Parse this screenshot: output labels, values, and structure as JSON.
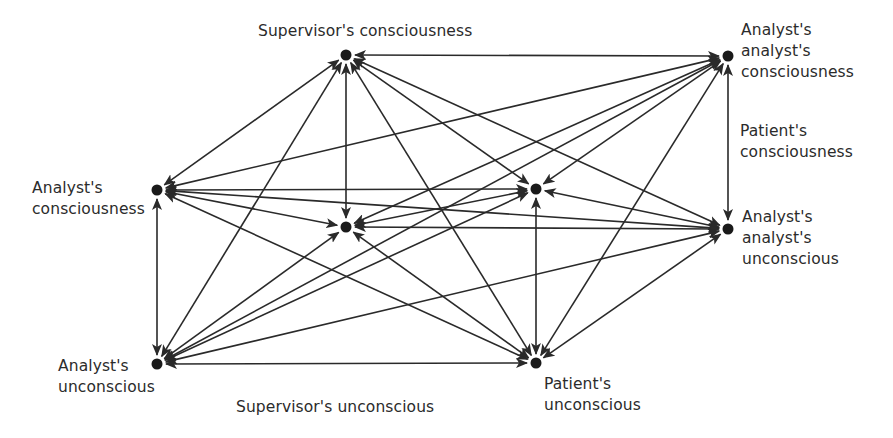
{
  "colors": {
    "ink": "#2a2a2a",
    "node": "#1a1a1a",
    "text": "#2b2b2b",
    "background": "#ffffff"
  },
  "nodes": [
    {
      "id": "sup_c",
      "label": "Supervisor's consciousness",
      "x": 346,
      "y": 55
    },
    {
      "id": "aa_c",
      "label": "Analyst's\nanalyst's\nconsciousness",
      "x": 728,
      "y": 56
    },
    {
      "id": "an_c",
      "label": "Analyst's\nconsciousness",
      "x": 157,
      "y": 190
    },
    {
      "id": "pat_c",
      "label": "Patient's\nconsciousness",
      "x": 536,
      "y": 189
    },
    {
      "id": "sup_u",
      "label": "Supervisor's unconscious",
      "x": 346,
      "y": 227
    },
    {
      "id": "aa_u",
      "label": "Analyst's\nanalyst's\nunconscious",
      "x": 728,
      "y": 229
    },
    {
      "id": "an_u",
      "label": "Analyst's\nunconscious",
      "x": 157,
      "y": 364
    },
    {
      "id": "pat_u",
      "label": "Patient's\nunconscious",
      "x": 536,
      "y": 363
    }
  ],
  "labels": {
    "sup_c": {
      "text": "Supervisor's consciousness",
      "left": 258,
      "top": 21
    },
    "aa_c": {
      "text": "Analyst's\nanalyst's\nconsciousness",
      "left": 741,
      "top": 20
    },
    "pat_c": {
      "text": "Patient's\nconsciousness",
      "left": 740,
      "top": 121
    },
    "an_c": {
      "text": "Analyst's\nconsciousness",
      "left": 32,
      "top": 178
    },
    "aa_u": {
      "text": "Analyst's\nanalyst's\nunconscious",
      "left": 742,
      "top": 207
    },
    "an_u": {
      "text": "Analyst's\nunconscious",
      "left": 58,
      "top": 356
    },
    "sup_u": {
      "text": "Supervisor's unconscious",
      "left": 236,
      "top": 397
    },
    "pat_u": {
      "text": "Patient's\nunconscious",
      "left": 544,
      "top": 374
    }
  },
  "edges": "complete-bidirectional",
  "arrowheads": "both-ends"
}
